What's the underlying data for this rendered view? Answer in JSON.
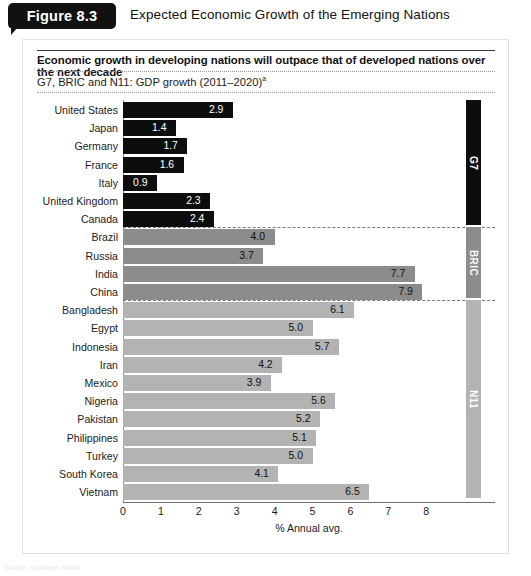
{
  "figure": {
    "badge_label": "Figure 8.3",
    "title": "Expected Economic Growth of the Emerging Nations"
  },
  "panel": {
    "subtitle": "Economic growth in developing nations will outpace that of developed nations over the next decade",
    "caption": "G7, BRIC and N11: GDP growth (2011–2020)",
    "caption_superscript": "a"
  },
  "source_note": "Source: Goldman Sachs",
  "colors": {
    "g7": "#0d0d0d",
    "bric": "#8c8c8c",
    "n11": "#b3b3b3",
    "panel_background": "#ffffff",
    "page_background": "#ffffff",
    "badge_background": "#111111"
  },
  "groups": [
    {
      "key": "g7",
      "label": "G7",
      "color": "#0d0d0d"
    },
    {
      "key": "bric",
      "label": "BRIC",
      "color": "#8c8c8c"
    },
    {
      "key": "n11",
      "label": "N11",
      "color": "#b3b3b3"
    }
  ],
  "chart_data": {
    "type": "bar",
    "orientation": "horizontal",
    "title": "Expected Economic Growth of the Emerging Nations",
    "subtitle": "Economic growth in developing nations will outpace that of developed nations over the next decade",
    "caption": "G7, BRIC and N11: GDP growth (2011–2020)a",
    "xlabel": "% Annual avg.",
    "ylabel": "",
    "xlim": [
      0,
      8
    ],
    "xticks": [
      0,
      1,
      2,
      3,
      4,
      5,
      6,
      7,
      8
    ],
    "xticklabels": [
      "0",
      "1",
      "2",
      "3",
      "4",
      "5",
      "6",
      "7",
      "8"
    ],
    "grid": false,
    "legend": "right-side group bars (G7, BRIC, N11)",
    "categories": [
      "United States",
      "Japan",
      "Germany",
      "France",
      "Italy",
      "United Kingdom",
      "Canada",
      "Brazil",
      "Russia",
      "India",
      "China",
      "Bangladesh",
      "Egypt",
      "Indonesia",
      "Iran",
      "Mexico",
      "Nigeria",
      "Pakistan",
      "Philippines",
      "Turkey",
      "South Korea",
      "Vietnam"
    ],
    "values": [
      2.9,
      1.4,
      1.7,
      1.6,
      0.9,
      2.3,
      2.4,
      4.0,
      3.7,
      7.7,
      7.9,
      6.1,
      5.0,
      5.7,
      4.2,
      3.9,
      5.6,
      5.2,
      5.1,
      5.0,
      4.1,
      6.5
    ],
    "bars": [
      {
        "label": "United States",
        "value": 2.9,
        "display": "2.9",
        "group": "g7"
      },
      {
        "label": "Japan",
        "value": 1.4,
        "display": "1.4",
        "group": "g7"
      },
      {
        "label": "Germany",
        "value": 1.7,
        "display": "1.7",
        "group": "g7"
      },
      {
        "label": "France",
        "value": 1.6,
        "display": "1.6",
        "group": "g7"
      },
      {
        "label": "Italy",
        "value": 0.9,
        "display": "0.9",
        "group": "g7"
      },
      {
        "label": "United Kingdom",
        "value": 2.3,
        "display": "2.3",
        "group": "g7"
      },
      {
        "label": "Canada",
        "value": 2.4,
        "display": "2.4",
        "group": "g7"
      },
      {
        "label": "Brazil",
        "value": 4.0,
        "display": "4.0",
        "group": "bric"
      },
      {
        "label": "Russia",
        "value": 3.7,
        "display": "3.7",
        "group": "bric"
      },
      {
        "label": "India",
        "value": 7.7,
        "display": "7.7",
        "group": "bric"
      },
      {
        "label": "China",
        "value": 7.9,
        "display": "7.9",
        "group": "bric"
      },
      {
        "label": "Bangladesh",
        "value": 6.1,
        "display": "6.1",
        "group": "n11"
      },
      {
        "label": "Egypt",
        "value": 5.0,
        "display": "5.0",
        "group": "n11"
      },
      {
        "label": "Indonesia",
        "value": 5.7,
        "display": "5.7",
        "group": "n11"
      },
      {
        "label": "Iran",
        "value": 4.2,
        "display": "4.2",
        "group": "n11"
      },
      {
        "label": "Mexico",
        "value": 3.9,
        "display": "3.9",
        "group": "n11"
      },
      {
        "label": "Nigeria",
        "value": 5.6,
        "display": "5.6",
        "group": "n11"
      },
      {
        "label": "Pakistan",
        "value": 5.2,
        "display": "5.2",
        "group": "n11"
      },
      {
        "label": "Philippines",
        "value": 5.1,
        "display": "5.1",
        "group": "n11"
      },
      {
        "label": "Turkey",
        "value": 5.0,
        "display": "5.0",
        "group": "n11"
      },
      {
        "label": "South Korea",
        "value": 4.1,
        "display": "4.1",
        "group": "n11"
      },
      {
        "label": "Vietnam",
        "value": 6.5,
        "display": "6.5",
        "group": "n11"
      }
    ]
  }
}
